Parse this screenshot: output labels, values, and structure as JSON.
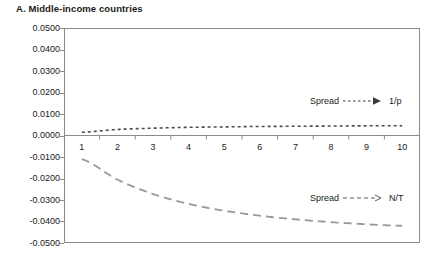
{
  "chart_data": {
    "type": "line",
    "title": "A. Middle-income countries",
    "xlabel": "",
    "ylabel": "",
    "xlim": [
      0.5,
      10.5
    ],
    "ylim": [
      -0.05,
      0.05
    ],
    "grid": false,
    "legend_position": "inside-right",
    "x_tick_labels": [
      "1",
      "2",
      "3",
      "4",
      "5",
      "6",
      "7",
      "8",
      "9",
      "10"
    ],
    "y_tick_labels": [
      "0.0500",
      "0.0400",
      "0.0300",
      "0.0200",
      "0.0100",
      "0.0000",
      "-0.0100",
      "-0.0200",
      "-0.0300",
      "-0.0400",
      "-0.0500"
    ],
    "y_tick_values": [
      0.05,
      0.04,
      0.03,
      0.02,
      0.01,
      0.0,
      -0.01,
      -0.02,
      -0.03,
      -0.04,
      -0.05
    ],
    "x": [
      1,
      2,
      3,
      4,
      5,
      6,
      7,
      8,
      9,
      10
    ],
    "series": [
      {
        "name": "Spread → 1/p",
        "style": "dotted",
        "color": "#4d4d4d",
        "values": [
          0.0015,
          0.0028,
          0.0034,
          0.0038,
          0.004,
          0.0042,
          0.0043,
          0.0044,
          0.0045,
          0.0045
        ]
      },
      {
        "name": "Spread → N/T",
        "style": "dashed",
        "color": "#999999",
        "values": [
          -0.011,
          -0.0205,
          -0.0272,
          -0.0318,
          -0.035,
          -0.0373,
          -0.039,
          -0.0403,
          -0.0413,
          -0.042
        ]
      }
    ],
    "annotations": [
      {
        "id": "legend-1p",
        "label": "Spread",
        "target": "1/p",
        "arrow": "dotted"
      },
      {
        "id": "legend-nt",
        "label": "Spread",
        "target": "N/T",
        "arrow": "dashed"
      }
    ]
  },
  "legend": {
    "spread_label": "Spread",
    "one_over_p": "1/p",
    "n_over_t": "N/T"
  }
}
